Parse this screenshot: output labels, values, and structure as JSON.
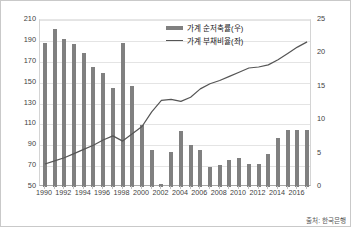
{
  "chart_data": {
    "type": "bar",
    "title": "",
    "xlabel": "",
    "categories": [
      1990,
      1991,
      1992,
      1993,
      1994,
      1995,
      1996,
      1997,
      1998,
      1999,
      2000,
      2001,
      2002,
      2003,
      2004,
      2005,
      2006,
      2007,
      2008,
      2009,
      2010,
      2011,
      2012,
      2013,
      2014,
      2015,
      2016,
      2017
    ],
    "xtick_labels": [
      "1990",
      "1992",
      "1994",
      "1996",
      "1998",
      "2000",
      "2002",
      "2004",
      "2006",
      "2008",
      "2010",
      "2012",
      "2014",
      "2016"
    ],
    "grid": true,
    "legend_position": "top-right",
    "series": [
      {
        "name": "가계 순저축률(우)",
        "type": "bar",
        "axis": "right",
        "color": "#808080",
        "ylabel": "",
        "ylim": [
          0,
          25
        ],
        "yticks": [
          0,
          5,
          10,
          15,
          20,
          25
        ],
        "values": [
          21.6,
          23.6,
          22.2,
          21.4,
          20.1,
          18.0,
          17.1,
          14.9,
          21.6,
          15.2,
          9.3,
          5.6,
          0.5,
          5.2,
          8.4,
          6.3,
          5.6,
          3.0,
          3.3,
          4.0,
          4.3,
          3.4,
          3.4,
          5.0,
          7.4,
          8.5,
          8.6,
          8.6
        ]
      },
      {
        "name": "가계 부채비율(좌)",
        "type": "line",
        "axis": "left",
        "color": "#555555",
        "ylabel": "",
        "ylim": [
          50,
          210
        ],
        "yticks": [
          50,
          70,
          90,
          110,
          130,
          150,
          170,
          190,
          210
        ],
        "values": [
          72,
          75,
          78,
          82,
          86,
          90,
          95,
          99,
          94,
          101,
          108,
          122,
          133,
          134,
          132,
          136,
          144,
          149,
          152,
          156,
          160,
          164,
          165,
          167,
          172,
          178,
          184,
          189
        ]
      }
    ]
  },
  "source": {
    "text": "출처: 한국은행"
  }
}
